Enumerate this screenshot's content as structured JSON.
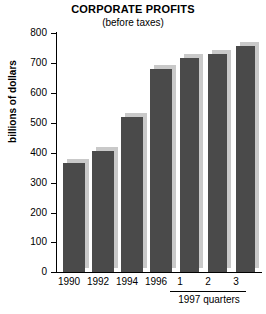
{
  "chart_data": {
    "type": "bar",
    "title": "CORPORATE PROFITS",
    "subtitle": "(before taxes)",
    "xlabel": "",
    "ylabel": "billions of dollars",
    "ylim": [
      0,
      800
    ],
    "ytick_step": 100,
    "yticks": [
      "800",
      "700",
      "600",
      "500",
      "400",
      "300",
      "200",
      "100",
      "0"
    ],
    "grid": false,
    "legend": null,
    "categories": [
      "1990",
      "1992",
      "1994",
      "1996",
      "1",
      "2",
      "3"
    ],
    "values": [
      365,
      405,
      520,
      680,
      715,
      730,
      755
    ],
    "group_annotation": {
      "label": "1997 quarters",
      "members": [
        "1",
        "2",
        "3"
      ]
    },
    "bars": [
      {
        "category": "1990",
        "value": 365
      },
      {
        "category": "1992",
        "value": 405
      },
      {
        "category": "1994",
        "value": 520
      },
      {
        "category": "1996",
        "value": 680
      },
      {
        "category": "1",
        "value": 715
      },
      {
        "category": "2",
        "value": 730
      },
      {
        "category": "3",
        "value": 755
      }
    ],
    "colors": {
      "bar_fill": "#4a4a4a",
      "bar_shadow": "#c9c9c9",
      "axis": "#000000",
      "background": "#ffffff"
    }
  }
}
